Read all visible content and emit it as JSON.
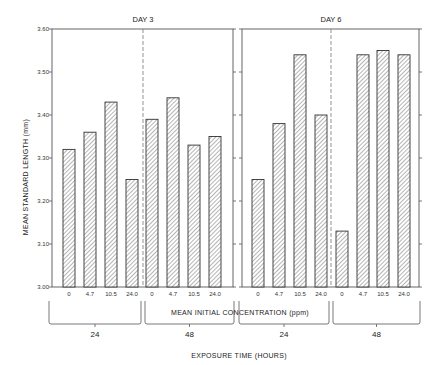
{
  "chart_data": {
    "type": "bar",
    "title": "",
    "ylabel": "MEAN STANDARD LENGTH (mm)",
    "xlabel": "EXPOSURE TIME (HOURS)",
    "secondary_xlabel": "MEAN INITIAL CONCENTRATION (ppm)",
    "ylim": [
      3.0,
      3.6
    ],
    "yticks": [
      "3.00",
      "3.10",
      "3.20",
      "3.30",
      "3.40",
      "3.50",
      "3.60"
    ],
    "grid": false,
    "legend": null,
    "categories": [
      "0",
      "4.7",
      "10.5",
      "24.0"
    ],
    "exposure_groups": [
      "24",
      "48"
    ],
    "panels": [
      {
        "title": "DAY 3",
        "series": [
          {
            "name": "24",
            "values": [
              3.32,
              3.36,
              3.43,
              3.25
            ]
          },
          {
            "name": "48",
            "values": [
              3.39,
              3.44,
              3.33,
              3.35
            ]
          }
        ]
      },
      {
        "title": "DAY 6",
        "series": [
          {
            "name": "24",
            "values": [
              3.25,
              3.38,
              3.54,
              3.4
            ]
          },
          {
            "name": "48",
            "values": [
              3.13,
              3.54,
              3.55,
              3.54
            ]
          }
        ]
      }
    ]
  },
  "colors": {
    "axis": "#555555",
    "bar_stroke": "#333333",
    "hatch": "#666666",
    "background": "#ffffff"
  }
}
